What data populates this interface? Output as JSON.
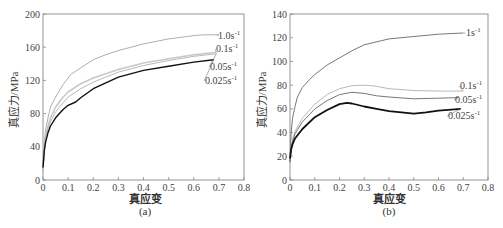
{
  "chart_data": [
    {
      "id": "a",
      "type": "line",
      "caption": "(a)",
      "title": "",
      "xlabel": "真应变",
      "ylabel": "真应力/MPa",
      "xlim": [
        0,
        0.8
      ],
      "ylim": [
        0,
        200
      ],
      "xticks": [
        "0",
        "0.1",
        "0.2",
        "0.3",
        "0.4",
        "0.5",
        "0.6",
        "0.7",
        "0.8"
      ],
      "yticks": [
        "0",
        "40",
        "80",
        "120",
        "160",
        "200"
      ],
      "grid": false,
      "legend_position": "inline-right",
      "series": [
        {
          "name": "1.0s⁻¹",
          "label_main": "1.0s",
          "color": "#9a9a9a",
          "width": 0.8,
          "x": [
            0,
            0.005,
            0.01,
            0.02,
            0.03,
            0.05,
            0.08,
            0.11,
            0.15,
            0.2,
            0.25,
            0.3,
            0.4,
            0.5,
            0.6,
            0.64,
            0.7
          ],
          "y": [
            15,
            45,
            60,
            75,
            88,
            100,
            115,
            127,
            135,
            145,
            151,
            156,
            164,
            170,
            174,
            175,
            175
          ]
        },
        {
          "name": "0.1s⁻¹",
          "label_main": "0.1s",
          "color": "#c8c8c8",
          "width": 1.6,
          "x": [
            0,
            0.005,
            0.01,
            0.02,
            0.03,
            0.05,
            0.08,
            0.1,
            0.15,
            0.2,
            0.3,
            0.4,
            0.5,
            0.6,
            0.69
          ],
          "y": [
            12,
            40,
            52,
            65,
            75,
            88,
            100,
            106,
            116,
            123,
            133,
            141,
            146,
            151,
            154
          ]
        },
        {
          "name": "0.05s⁻¹",
          "label_main": "0.05s",
          "color": "#b0b0b0",
          "width": 0.9,
          "x": [
            0,
            0.005,
            0.01,
            0.02,
            0.03,
            0.05,
            0.08,
            0.1,
            0.15,
            0.2,
            0.3,
            0.4,
            0.5,
            0.6,
            0.69
          ],
          "y": [
            10,
            38,
            50,
            62,
            70,
            82,
            93,
            100,
            110,
            118,
            130,
            138,
            144,
            149,
            152
          ]
        },
        {
          "name": "0.025s⁻¹",
          "label_main": "0.025s",
          "color": "#111111",
          "width": 1.4,
          "x": [
            0,
            0.005,
            0.01,
            0.02,
            0.03,
            0.05,
            0.08,
            0.1,
            0.13,
            0.15,
            0.2,
            0.3,
            0.4,
            0.5,
            0.6,
            0.68
          ],
          "y": [
            15,
            35,
            45,
            57,
            65,
            75,
            85,
            90,
            94,
            99,
            110,
            124,
            132,
            137,
            142,
            145
          ]
        }
      ],
      "annotations": [
        {
          "text": "1.0s⁻¹",
          "x_px": 218,
          "y_px": 39
        },
        {
          "text": "0.1s⁻¹",
          "x_px": 216,
          "y_px": 52
        },
        {
          "text": "0.05s⁻¹",
          "x_px": 210,
          "y_px": 70
        },
        {
          "text": "0.025s⁻¹",
          "x_px": 205,
          "y_px": 84
        }
      ]
    },
    {
      "id": "b",
      "type": "line",
      "caption": "(b)",
      "title": "",
      "xlabel": "真应变",
      "ylabel": "真应力/MPa",
      "xlim": [
        0,
        0.8
      ],
      "ylim": [
        0,
        140
      ],
      "xticks": [
        "0",
        "0.1",
        "0.2",
        "0.3",
        "0.4",
        "0.5",
        "0.6",
        "0.7",
        "0.8"
      ],
      "yticks": [
        "0",
        "20",
        "40",
        "60",
        "80",
        "100",
        "120",
        "140"
      ],
      "grid": false,
      "legend_position": "inline-right",
      "series": [
        {
          "name": "1s⁻¹",
          "label_main": "1s",
          "color": "#555555",
          "width": 0.8,
          "x": [
            0,
            0.005,
            0.01,
            0.02,
            0.03,
            0.05,
            0.08,
            0.1,
            0.15,
            0.2,
            0.25,
            0.3,
            0.4,
            0.5,
            0.6,
            0.7
          ],
          "y": [
            15,
            40,
            52,
            62,
            70,
            78,
            85,
            89,
            97,
            103,
            109,
            114,
            119,
            121,
            123,
            124
          ]
        },
        {
          "name": "0.1s⁻¹",
          "label_main": "0.1s",
          "color": "#b8b8b8",
          "width": 1.0,
          "x": [
            0,
            0.005,
            0.01,
            0.02,
            0.05,
            0.1,
            0.15,
            0.2,
            0.25,
            0.3,
            0.35,
            0.4,
            0.5,
            0.6,
            0.7
          ],
          "y": [
            15,
            28,
            34,
            41,
            52,
            64,
            72,
            77,
            79.5,
            80,
            79,
            77,
            75.5,
            75,
            75
          ]
        },
        {
          "name": "0.05s⁻¹",
          "label_main": "0.05s",
          "color": "#666666",
          "width": 0.9,
          "x": [
            0,
            0.005,
            0.01,
            0.02,
            0.05,
            0.1,
            0.15,
            0.2,
            0.25,
            0.3,
            0.35,
            0.4,
            0.5,
            0.6,
            0.68
          ],
          "y": [
            15,
            27,
            32,
            39,
            49,
            60,
            67,
            72,
            74,
            73,
            71,
            70,
            68.5,
            69,
            69.5
          ]
        },
        {
          "name": "0.025s⁻¹",
          "label_main": "0.025s",
          "color": "#111111",
          "width": 1.8,
          "x": [
            0,
            0.005,
            0.01,
            0.02,
            0.05,
            0.1,
            0.15,
            0.2,
            0.23,
            0.25,
            0.3,
            0.35,
            0.4,
            0.45,
            0.5,
            0.55,
            0.6,
            0.69
          ],
          "y": [
            18,
            26,
            30,
            35,
            43,
            53,
            59,
            64,
            65,
            64.5,
            62,
            60,
            58,
            57,
            56,
            57,
            58.5,
            60
          ]
        }
      ],
      "annotations": [
        {
          "text": "1s⁻¹",
          "x_px": 466,
          "y_px": 36
        },
        {
          "text": "0.1s⁻¹",
          "x_px": 460,
          "y_px": 89
        },
        {
          "text": "0.05s⁻¹",
          "x_px": 455,
          "y_px": 103
        },
        {
          "text": "0.025s⁻¹",
          "x_px": 448,
          "y_px": 119
        }
      ]
    }
  ],
  "panels": {
    "a": {
      "caption": "(a)",
      "xlabel": "真应变",
      "ylabel": "真应力/MPa"
    },
    "b": {
      "caption": "(b)",
      "xlabel": "真应变",
      "ylabel": "真应力/MPa"
    }
  }
}
